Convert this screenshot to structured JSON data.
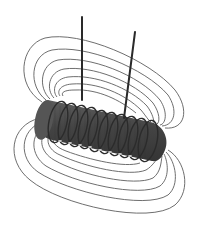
{
  "figure": {
    "subject": "Solenoid coil with magnetic field lines",
    "colors": {
      "background": "#ffffff",
      "field_line": "#5a5a5a",
      "coil_body": "#4a4a4a",
      "coil_dark": "#2e2e2e",
      "coil_highlight": "#8a8a8a",
      "wire": "#2a2a2a"
    },
    "coil_turns": 10,
    "lead_wires": 2
  }
}
